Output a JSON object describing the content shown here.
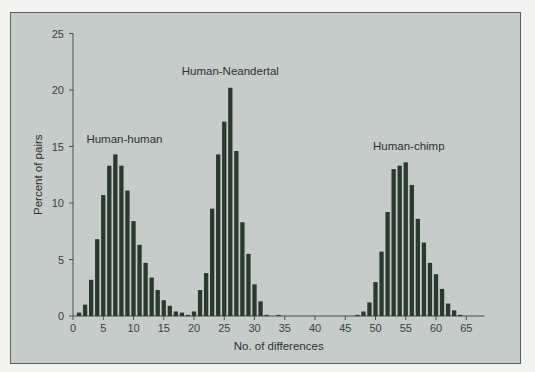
{
  "chart_data": {
    "type": "bar",
    "title": "",
    "xlabel": "No. of differences",
    "ylabel": "Percent of pairs",
    "xlim": [
      0,
      68
    ],
    "ylim": [
      0,
      25
    ],
    "xticks": [
      0,
      5,
      10,
      15,
      20,
      25,
      30,
      35,
      40,
      45,
      50,
      55,
      60,
      65
    ],
    "yticks": [
      0,
      5,
      10,
      15,
      20,
      25
    ],
    "grid": false,
    "legend": "none (inline annotations)",
    "bar_color": "#2a3a2e",
    "background_color": "#c5ccc9",
    "series": [
      {
        "name": "Human-human",
        "x": [
          1,
          2,
          3,
          4,
          5,
          6,
          7,
          8,
          9,
          10,
          11,
          12,
          13,
          14,
          15,
          16,
          17,
          18,
          19
        ],
        "values": [
          0.3,
          1.0,
          3.2,
          6.8,
          10.7,
          13.3,
          14.3,
          13.3,
          11.1,
          8.4,
          6.3,
          4.7,
          3.4,
          2.3,
          1.4,
          0.9,
          0.4,
          0.3,
          0.1
        ],
        "annotation": {
          "text": "Human-human",
          "x": 8.5,
          "y": 15.3
        }
      },
      {
        "name": "Human-Neandertal",
        "x": [
          20,
          21,
          22,
          23,
          24,
          25,
          26,
          27,
          28,
          29,
          30,
          31,
          32,
          34
        ],
        "values": [
          0.4,
          2.3,
          3.8,
          9.5,
          14.3,
          17.2,
          20.2,
          14.6,
          8.3,
          5.5,
          2.8,
          1.3,
          0.1,
          0.1
        ],
        "annotation": {
          "text": "Human-Neandertal",
          "x": 26,
          "y": 21.3
        }
      },
      {
        "name": "Human-chimp",
        "x": [
          47,
          48,
          49,
          50,
          51,
          52,
          53,
          54,
          55,
          56,
          57,
          58,
          59,
          60,
          61,
          62,
          63,
          64
        ],
        "values": [
          0.1,
          0.4,
          1.2,
          3.0,
          5.7,
          9.2,
          13.0,
          13.3,
          13.6,
          11.6,
          8.6,
          6.5,
          4.7,
          3.7,
          2.4,
          1.1,
          0.5,
          0.1
        ],
        "annotation": {
          "text": "Human-chimp",
          "x": 55.5,
          "y": 14.7
        }
      }
    ]
  }
}
